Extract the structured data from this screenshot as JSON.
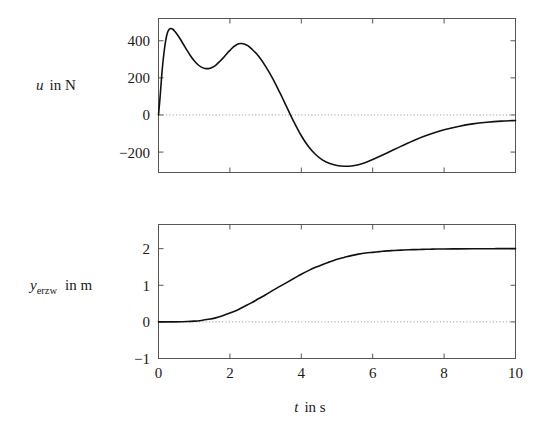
{
  "figure": {
    "background": "#ffffff",
    "line_color": "#111111",
    "axis_color": "#555555",
    "zero_line_color": "#999999"
  },
  "chart_data": [
    {
      "type": "line",
      "id": "top-plot",
      "title": "",
      "xlabel": "t in s",
      "ylabel": "u in N",
      "ylabel_symbol": "u",
      "ylabel_rest": "in N",
      "xlabel_symbol": "t",
      "xlabel_rest": "in s",
      "xlim": [
        0,
        10
      ],
      "ylim": [
        -310,
        520
      ],
      "xticks": [
        0,
        2,
        4,
        6,
        8,
        10
      ],
      "xticklabels": [
        "",
        "",
        "",
        "",
        "",
        ""
      ],
      "yticks": [
        400,
        200,
        0,
        -200
      ],
      "yticklabels": [
        "400",
        "200",
        "0",
        "−200"
      ],
      "grid": false,
      "zero_line": true,
      "zero_line_style": "dotted",
      "legend": "none",
      "series": [
        {
          "name": "u",
          "x": [
            0.0,
            0.05,
            0.1,
            0.15,
            0.2,
            0.25,
            0.3,
            0.35,
            0.4,
            0.45,
            0.5,
            0.6,
            0.7,
            0.8,
            0.9,
            1.0,
            1.1,
            1.2,
            1.3,
            1.4,
            1.5,
            1.6,
            1.7,
            1.8,
            1.9,
            2.0,
            2.1,
            2.2,
            2.3,
            2.4,
            2.5,
            2.6,
            2.8,
            3.0,
            3.2,
            3.4,
            3.5,
            3.6,
            3.8,
            4.0,
            4.2,
            4.4,
            4.6,
            4.8,
            5.0,
            5.2,
            5.4,
            5.6,
            5.8,
            6.0,
            6.4,
            6.8,
            7.2,
            7.6,
            8.0,
            8.4,
            8.8,
            9.2,
            9.6,
            10.0
          ],
          "y": [
            0,
            110,
            235,
            330,
            400,
            443,
            462,
            466,
            462,
            452,
            440,
            412,
            380,
            348,
            318,
            292,
            272,
            258,
            251,
            250,
            256,
            268,
            286,
            305,
            327,
            348,
            367,
            380,
            385,
            383,
            374,
            358,
            318,
            262,
            196,
            120,
            80,
            40,
            -40,
            -112,
            -170,
            -213,
            -243,
            -262,
            -272,
            -276,
            -275,
            -268,
            -256,
            -240,
            -205,
            -168,
            -133,
            -104,
            -80,
            -62,
            -48,
            -39,
            -33,
            -30
          ]
        }
      ]
    },
    {
      "type": "line",
      "id": "bottom-plot",
      "title": "",
      "xlabel": "t in s",
      "ylabel": "y_erzw in m",
      "ylabel_symbol": "y",
      "ylabel_subscript": "erzw",
      "ylabel_rest": "in m",
      "xlabel_symbol": "t",
      "xlabel_rest": "in s",
      "xlim": [
        0,
        10
      ],
      "ylim": [
        -1,
        2.66
      ],
      "xticks": [
        0,
        2,
        4,
        6,
        8,
        10
      ],
      "xticklabels": [
        "0",
        "2",
        "4",
        "6",
        "8",
        "10"
      ],
      "yticks": [
        2,
        1,
        0,
        -1
      ],
      "yticklabels": [
        "2",
        "1",
        "0",
        "−1"
      ],
      "grid": false,
      "zero_line": true,
      "zero_line_style": "dotted",
      "legend": "none",
      "series": [
        {
          "name": "y_erzw",
          "x": [
            0.0,
            0.4,
            0.8,
            1.0,
            1.2,
            1.4,
            1.6,
            1.8,
            2.0,
            2.2,
            2.4,
            2.6,
            2.8,
            3.0,
            3.2,
            3.4,
            3.6,
            3.8,
            4.0,
            4.2,
            4.4,
            4.6,
            4.8,
            5.0,
            5.2,
            5.4,
            5.6,
            5.8,
            6.0,
            6.2,
            6.4,
            6.6,
            6.8,
            7.0,
            7.2,
            7.4,
            7.6,
            7.8,
            8.0,
            8.4,
            8.8,
            9.2,
            9.6,
            10.0
          ],
          "y": [
            0.0,
            0.0,
            0.01,
            0.02,
            0.04,
            0.07,
            0.11,
            0.17,
            0.24,
            0.32,
            0.42,
            0.52,
            0.63,
            0.74,
            0.86,
            0.97,
            1.08,
            1.19,
            1.3,
            1.4,
            1.49,
            1.57,
            1.64,
            1.71,
            1.76,
            1.81,
            1.85,
            1.88,
            1.9,
            1.92,
            1.94,
            1.95,
            1.96,
            1.97,
            1.975,
            1.98,
            1.985,
            1.99,
            1.99,
            1.995,
            1.998,
            1.999,
            2.0,
            2.0
          ]
        }
      ]
    }
  ],
  "axes": {
    "shared_xlabel": "t in s",
    "top": {
      "ylabel_symbol": "u",
      "ylabel_rest": "in N",
      "yticklabels": [
        "400",
        "200",
        "0",
        "−200"
      ]
    },
    "bottom": {
      "ylabel_symbol": "y",
      "ylabel_subscript": "erzw",
      "ylabel_rest": "in m",
      "yticklabels": [
        "2",
        "1",
        "0",
        "−1"
      ],
      "xticklabels": [
        "0",
        "2",
        "4",
        "6",
        "8",
        "10"
      ]
    }
  }
}
